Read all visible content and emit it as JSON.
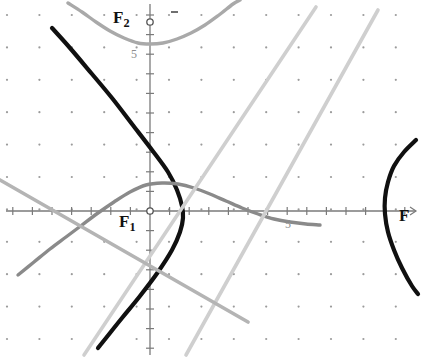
{
  "figure": {
    "background_color": "#ffffff",
    "width": 422,
    "height": 359
  },
  "labels": {
    "focus_upper": {
      "text": "F",
      "subscript": "2",
      "x": 113,
      "y": 9
    },
    "focus_lower": {
      "text": "F",
      "subscript": "1",
      "x": 119,
      "y": 213
    },
    "axis_end": {
      "text": "F",
      "x": 399,
      "y": 207
    }
  },
  "markers": [
    {
      "name": "point-F2",
      "x": 150,
      "y": 22,
      "style": "open-circle",
      "color": "#555555"
    },
    {
      "name": "point-F1-origin",
      "x": 150,
      "y": 211,
      "style": "open-circle",
      "color": "#555555"
    }
  ],
  "axes": {
    "origin": {
      "x": 150,
      "y": 211
    },
    "tick_spacing_px": 19.6,
    "x_axis": {
      "y": 211,
      "x_start": 6,
      "x_end": 416,
      "color": "#7a7a7a",
      "arrow": "right"
    },
    "y_axis": {
      "x": 150,
      "y_start": 4,
      "y_end": 355,
      "color": "#7a7a7a",
      "arrow": "none"
    },
    "tick_labels": [
      {
        "text": "5",
        "axis": "y",
        "x": 131,
        "y": 48
      },
      {
        "text": "5",
        "axis": "x",
        "x": 285,
        "y": 218
      }
    ]
  },
  "grid": {
    "type": "dots",
    "dot_color": "#9b9b9b",
    "dot_radius": 1.1,
    "spacing_px": 32.4,
    "offset_x": 7,
    "offset_y": 15
  },
  "chart_data": {
    "type": "line",
    "xlabel": "",
    "ylabel": "",
    "xlim": [
      -7.3,
      13.6
    ],
    "ylim": [
      -7.3,
      10.6
    ],
    "grid": "dots",
    "legend": "none",
    "series": [
      {
        "name": "hyperbola-black",
        "type": "hyperbola",
        "color": "#101010",
        "stroke_width": 4.2,
        "description": "Thick black hyperbola, left branch opening left with vertex right of origin, right branch far right",
        "points_left_branch": [
          [
            52,
            28
          ],
          [
            70,
            48
          ],
          [
            92,
            74
          ],
          [
            112,
            98
          ],
          [
            132,
            124
          ],
          [
            152,
            150
          ],
          [
            168,
            172
          ],
          [
            177,
            190
          ],
          [
            182,
            206
          ],
          [
            183,
            218
          ],
          [
            180,
            232
          ],
          [
            172,
            250
          ],
          [
            158,
            272
          ],
          [
            140,
            296
          ],
          [
            122,
            318
          ],
          [
            106,
            338
          ],
          [
            98,
            348
          ]
        ],
        "points_right_branch": [
          [
            416,
            140
          ],
          [
            404,
            152
          ],
          [
            394,
            166
          ],
          [
            388,
            182
          ],
          [
            385,
            198
          ],
          [
            385,
            214
          ],
          [
            388,
            232
          ],
          [
            394,
            250
          ],
          [
            402,
            268
          ],
          [
            412,
            286
          ],
          [
            418,
            294
          ]
        ]
      },
      {
        "name": "parabola-up-gray",
        "type": "parabola",
        "color": "#a9a9a9",
        "stroke_width": 3.4,
        "description": "Light-gray parabola opening upward with vertex just below the F2 point",
        "points": [
          [
            68,
            3
          ],
          [
            82,
            12
          ],
          [
            96,
            22
          ],
          [
            110,
            31
          ],
          [
            124,
            38
          ],
          [
            138,
            43
          ],
          [
            150,
            44
          ],
          [
            163,
            43
          ],
          [
            177,
            39
          ],
          [
            191,
            33
          ],
          [
            205,
            25
          ],
          [
            219,
            15
          ],
          [
            233,
            4
          ],
          [
            240,
            0
          ]
        ]
      },
      {
        "name": "parabola-down-gray",
        "type": "parabola",
        "color": "#8a8a8a",
        "stroke_width": 3.4,
        "description": "Medium-gray parabola opening downward/right with vertex above and left of origin",
        "points": [
          [
            18,
            275
          ],
          [
            34,
            262
          ],
          [
            50,
            249
          ],
          [
            66,
            237
          ],
          [
            82,
            225
          ],
          [
            98,
            213
          ],
          [
            114,
            202
          ],
          [
            130,
            192
          ],
          [
            146,
            185
          ],
          [
            162,
            183
          ],
          [
            178,
            184
          ],
          [
            194,
            188
          ],
          [
            210,
            194
          ],
          [
            226,
            201
          ],
          [
            242,
            208
          ],
          [
            258,
            214
          ],
          [
            274,
            219
          ],
          [
            290,
            222
          ],
          [
            306,
            224
          ],
          [
            320,
            225
          ]
        ]
      },
      {
        "name": "asymptote-line-left",
        "type": "line",
        "color": "#cfcfcf",
        "stroke_width": 3.6,
        "description": "Light-gray line rising to the right, passing through lower-left to upper-right",
        "points": [
          [
            84,
            355
          ],
          [
            316,
            7
          ]
        ]
      },
      {
        "name": "asymptote-line-right",
        "type": "line",
        "color": "#cfcfcf",
        "stroke_width": 3.6,
        "description": "Second light-gray line rising to the right, parallel-ish, further right",
        "points": [
          [
            186,
            355
          ],
          [
            378,
            10
          ]
        ]
      },
      {
        "name": "descending-gray-line",
        "type": "line",
        "color": "#b4b4b4",
        "stroke_width": 3.6,
        "description": "Gray line descending to the right, crossing the other curves near the origin region",
        "points": [
          [
            0,
            180
          ],
          [
            248,
            322
          ]
        ]
      }
    ],
    "annotations": [
      {
        "text": "F2",
        "x": 130,
        "y": 18,
        "note": "upper focus label on y-axis"
      },
      {
        "text": "F1",
        "x": 132,
        "y": 224,
        "note": "lower focus label at origin"
      },
      {
        "text": "F",
        "x": 403,
        "y": 215,
        "note": "label at right end of x-axis"
      },
      {
        "text": "5",
        "x": 134,
        "y": 54,
        "note": "y-axis tick label"
      },
      {
        "text": "5",
        "x": 289,
        "y": 224,
        "note": "x-axis tick label"
      }
    ]
  }
}
